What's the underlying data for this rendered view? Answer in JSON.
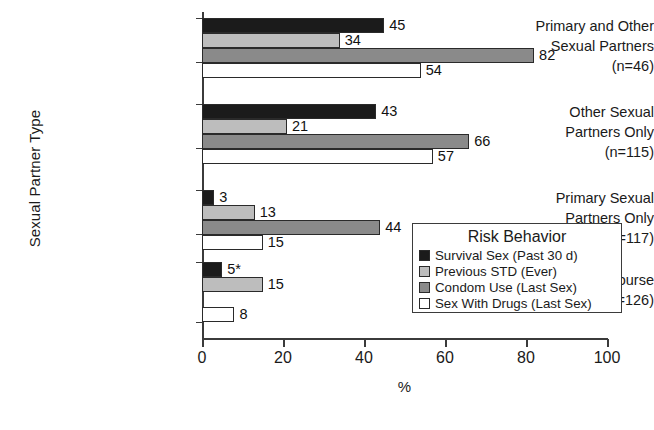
{
  "chart_data": {
    "type": "bar",
    "orientation": "horizontal",
    "title": "",
    "xlabel": "%",
    "ylabel": "Sexual Partner Type",
    "xlim": [
      0,
      100
    ],
    "xticks": [
      0,
      20,
      40,
      60,
      80,
      100
    ],
    "grid": false,
    "legend_title": "Risk Behavior",
    "legend_position": "lower right (inside plot)",
    "categories": [
      {
        "lines": [
          "Primary and Other",
          "Sexual Partners",
          "(n=46)"
        ],
        "n": 46
      },
      {
        "lines": [
          "Other Sexual",
          "Partners Only",
          "(n=115)"
        ],
        "n": 115
      },
      {
        "lines": [
          "Primary Sexual",
          "Partners Only",
          "(n=117)"
        ],
        "n": 117
      },
      {
        "lines": [
          "No Intercourse",
          "(n=126)"
        ],
        "n": 126
      }
    ],
    "series": [
      {
        "name": "Survival Sex (Past 30 d)",
        "color": "#1b1b1b",
        "values": [
          45,
          43,
          3,
          5
        ],
        "labels": [
          "45",
          "43",
          "3",
          "5*"
        ]
      },
      {
        "name": "Previous STD (Ever)",
        "color": "#bdbdbd",
        "values": [
          34,
          21,
          13,
          15
        ],
        "labels": [
          "34",
          "21",
          "13",
          "15"
        ]
      },
      {
        "name": "Condom Use (Last Sex)",
        "color": "#8a8a8a",
        "values": [
          82,
          66,
          44,
          null
        ],
        "labels": [
          "82",
          "66",
          "44",
          ""
        ]
      },
      {
        "name": "Sex With Drugs (Last Sex)",
        "color": "#ffffff",
        "values": [
          54,
          57,
          15,
          8
        ],
        "labels": [
          "54",
          "57",
          "15",
          "8"
        ]
      }
    ],
    "footnote_marker": "*"
  },
  "axis": {
    "xlabel": "%",
    "ylabel": "Sexual Partner Type",
    "xticklabels": [
      "0",
      "20",
      "40",
      "60",
      "80",
      "100"
    ]
  },
  "legend": {
    "title": "Risk Behavior",
    "items": [
      {
        "label": "Survival Sex (Past 30 d)",
        "swatch": "sw-black"
      },
      {
        "label": "Previous STD (Ever)",
        "swatch": "sw-light"
      },
      {
        "label": "Condom Use (Last Sex)",
        "swatch": "sw-mid"
      },
      {
        "label": "Sex With Drugs (Last Sex)",
        "swatch": "sw-white"
      }
    ]
  }
}
